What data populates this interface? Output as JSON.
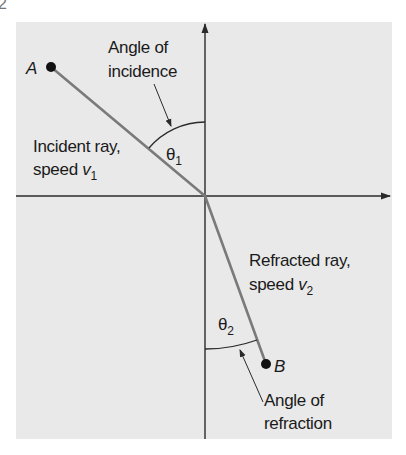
{
  "figure_number_fragment": "2",
  "colors": {
    "panel": "#e9e9e9",
    "axis": "#2a2a2a",
    "ray": "#7a7a7a",
    "text": "#1a1a1a"
  },
  "points": {
    "A": {
      "label": "A"
    },
    "B": {
      "label": "B"
    }
  },
  "incidence": {
    "title_line1": "Angle of",
    "title_line2": "incidence",
    "angle_symbol": "θ",
    "angle_sub": "1"
  },
  "incident_ray": {
    "line1": "Incident ray,",
    "line2_prefix": "speed ",
    "speed_symbol": "v",
    "speed_sub": "1"
  },
  "refracted_ray": {
    "line1": "Refracted ray,",
    "line2_prefix": "speed ",
    "speed_symbol": "v",
    "speed_sub": "2"
  },
  "refraction": {
    "title_line1": "Angle of",
    "title_line2": "refraction",
    "angle_symbol": "θ",
    "angle_sub": "2"
  }
}
